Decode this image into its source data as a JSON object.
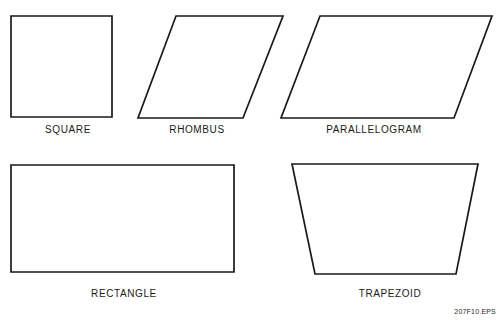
{
  "figure": {
    "id_label": "207F10.EPS",
    "background_color": "#ffffff",
    "stroke_color": "#1a1a1a",
    "label_color": "#1a1a1a",
    "width": 501,
    "height": 320
  },
  "diagram_data": {
    "type": "geometric-shapes-diagram",
    "description": "Five labeled quadrilaterals drawn as black outlines on white background, arranged in two rows",
    "rows": 2,
    "shapes": [
      {
        "name": "square",
        "label": "SQUARE",
        "row": 1,
        "column": 1,
        "sides": 4,
        "points": "11,16 112,16 112,117 11,117",
        "label_x": 68,
        "label_y": 124
      },
      {
        "name": "rhombus",
        "label": "RHOMBUS",
        "row": 1,
        "column": 2,
        "sides": 4,
        "points": "176,16 283,16 243,118 138,118",
        "label_x": 197,
        "label_y": 124
      },
      {
        "name": "parallelogram",
        "label": "PARALLELOGRAM",
        "row": 1,
        "column": 3,
        "sides": 4,
        "points": "320,16 492,16 454,118 281,118",
        "label_x": 374,
        "label_y": 124
      },
      {
        "name": "rectangle",
        "label": "RECTANGLE",
        "row": 2,
        "column": 1,
        "sides": 4,
        "points": "11,165 234,165 234,272 11,272",
        "label_x": 124,
        "label_y": 288
      },
      {
        "name": "trapezoid",
        "label": "TRAPEZOID",
        "row": 2,
        "column": 2,
        "sides": 4,
        "points": "292,164 478,164 456,274 315,274",
        "label_x": 390,
        "label_y": 288
      }
    ]
  }
}
